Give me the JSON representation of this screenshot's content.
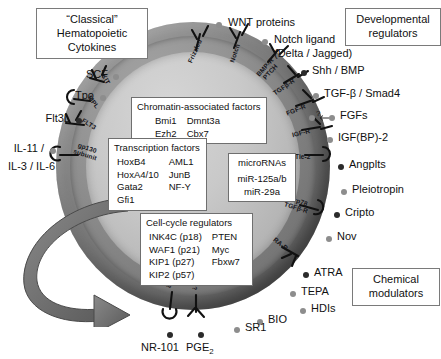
{
  "diagram": {
    "legends": {
      "classical": "“Classical” Hematopoietic Cytokines",
      "classical_lines": [
        "“Classical”",
        "Hematopoietic",
        "Cytokines"
      ],
      "developmental": "Developmental regulators",
      "developmental_lines": [
        "Developmental",
        "regulators"
      ],
      "chemical": "Chemical modulators",
      "chemical_lines": [
        "Chemical",
        "modulators"
      ]
    },
    "inner_boxes": {
      "chromatin": {
        "header": "Chromatin-associated factors",
        "rows": [
          [
            "Bmi1",
            "Dmnt3a"
          ],
          [
            "Ezh2",
            "Cbx7"
          ]
        ]
      },
      "transcription": {
        "header": "Transcription factors",
        "rows": [
          [
            "HoxB4",
            "AML1"
          ],
          [
            "HoxA4/10",
            "JunB"
          ],
          [
            "Gata2",
            "NF-Y"
          ],
          [
            "Gfi1",
            ""
          ]
        ]
      },
      "microrna": {
        "header": "microRNAs",
        "items": [
          "miR-125a/b",
          "miR-29a"
        ]
      },
      "cellcycle": {
        "header": "Cell-cycle regulators",
        "rows": [
          [
            "INK4C (p18)",
            "PTEN"
          ],
          [
            "WAF1 (p21)",
            "Myc"
          ],
          [
            "KIP1  (p27)",
            "Fbxw7"
          ],
          [
            "KIP2  (p57)",
            ""
          ]
        ]
      }
    },
    "ligands": {
      "scf": "SCF",
      "tpo": "Tpo",
      "flt3l": "Flt3L",
      "il11": "IL-11 /",
      "il3il6": "IL-3 / IL-6",
      "wnt": "WNT proteins",
      "notch1": "Notch ligand",
      "notch2": "(Delta / Jagged)",
      "shh_bmp": "Shh / BMP",
      "tgfb_smad4": "TGF-β / Smad4",
      "fgfs": "FGFs",
      "fgf_query": "?",
      "igfbp2": "IGF(BP)-2",
      "angplts": "Angplts",
      "pleiotropin": "Pleiotropin",
      "cripto": "Cripto",
      "nov": "Nov",
      "atra": "ATRA",
      "tepa": "TEPA",
      "hdis": "HDIs",
      "bio": "BIO",
      "sr1": "SR1",
      "pge2": "PGE",
      "pge2_sub": "2",
      "nr101": "NR-101"
    },
    "receptors": {
      "kit": "KIT",
      "mpl": "MPL",
      "flt3": "FLT3",
      "gp130_l1": "gp130",
      "gp130_l2": "subunit",
      "frizzled": "Frizzled",
      "notch": "Notch",
      "bmpr_l1": "BMP-R",
      "bmpr_l2": "PTCH",
      "tgfbr": "TGFβ-R",
      "fgfr": "FGF-R",
      "igfr": "IGF-R",
      "tie2": "Tie-2",
      "grp78_l1": "Grp78",
      "grp78_l2": "TGFβ-R",
      "rar": "RA-R",
      "unk1": "?",
      "unk2": "?"
    },
    "colors": {
      "ligand_dot": "#8d8d8d",
      "ligand_dot_dark": "#2b2b2b",
      "membrane": "#7b7b7b",
      "cytoplasm": "#c9c9c9",
      "box_border": "#6f6f6f",
      "arrow": "#6e6e6e",
      "text": "#111111"
    }
  }
}
